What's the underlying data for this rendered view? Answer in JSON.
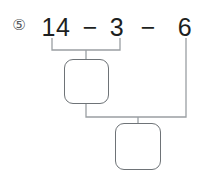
{
  "problem": {
    "number_label": "⑤",
    "number_text": "5",
    "expression_text": "14 - 3 - 6",
    "terms": [
      {
        "label": "14",
        "value": 14
      },
      {
        "label": "3",
        "value": 3
      },
      {
        "label": "6",
        "value": 6
      }
    ],
    "operators": [
      {
        "label": "−",
        "name": "minus"
      },
      {
        "label": "−",
        "name": "minus"
      }
    ]
  },
  "answer_boxes": [
    {
      "name": "first-step-answer",
      "value": "",
      "placeholder": "",
      "groups": "14 - 3"
    },
    {
      "name": "final-answer",
      "value": "",
      "placeholder": "",
      "groups": "first-step-answer - 6"
    }
  ],
  "colors": {
    "text": "#1d1f21",
    "problem_number": "#55585c",
    "box_border": "#6e7377",
    "connector": "#9a9fa3",
    "background": "#ffffff"
  },
  "connectors": [
    {
      "name": "bracket-14-minus-3",
      "description": "bracket under 14 and 3 leading into first answer box"
    },
    {
      "name": "bracket-step1-minus-6",
      "description": "bracket joining first answer box and 6 into final answer box"
    }
  ]
}
